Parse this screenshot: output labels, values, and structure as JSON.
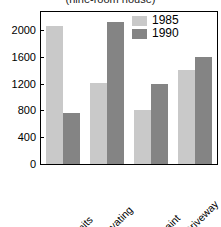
{
  "chart_data": {
    "type": "bar",
    "title": "(nine-room house)",
    "xlabel": "",
    "ylabel": "",
    "categories": [
      "Prints/Permits",
      "Excavating",
      "Exterior Paint",
      "Driveway"
    ],
    "series": [
      {
        "name": "1985",
        "color": "#c9c9c9",
        "values": [
          2060,
          1215,
          800,
          1400
        ]
      },
      {
        "name": "1990",
        "color": "#848484",
        "values": [
          755,
          2120,
          1200,
          1600
        ]
      }
    ],
    "ylim": [
      0,
      2270
    ],
    "yticks": [
      0,
      400,
      800,
      1200,
      1600,
      2000
    ],
    "ytick_labels": [
      "0",
      "400",
      "800",
      "1200",
      "1600",
      "2000"
    ],
    "grid": false,
    "legend_position": "top-right",
    "legend_entries": [
      "1985",
      "1990"
    ]
  }
}
